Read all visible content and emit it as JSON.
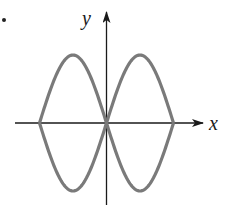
{
  "figure": {
    "x_axis_label": "x",
    "y_axis_label": "y",
    "curve_color": "#7a7a7a",
    "axis_color": "#1a1a1a"
  },
  "chart_data": {
    "type": "line",
    "title": "",
    "xlabel": "x",
    "ylabel": "y",
    "grid": false,
    "series": [
      {
        "name": "upper-left/lower-right branch",
        "x": [
          -3.1416,
          -1.5708,
          0,
          1.5708,
          3.1416
        ],
        "values": [
          0,
          1,
          0,
          -1,
          0
        ]
      },
      {
        "name": "lower-left/upper-right branch",
        "x": [
          -3.1416,
          -1.5708,
          0,
          1.5708,
          3.1416
        ],
        "values": [
          0,
          -1,
          0,
          1,
          0
        ]
      }
    ]
  }
}
